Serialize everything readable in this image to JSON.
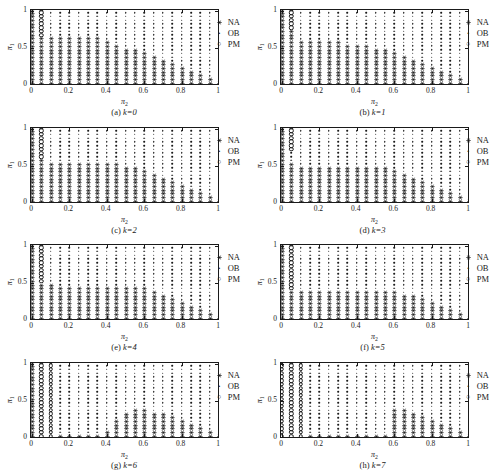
{
  "figure": {
    "panel_count": 8,
    "axis": {
      "xlabel": "π₂",
      "ylabel": "π₁",
      "xlim": [
        0,
        1
      ],
      "ylim": [
        0,
        1
      ],
      "xticks": [
        0,
        0.2,
        0.4,
        0.6,
        0.8,
        1
      ],
      "xticklabels": [
        "0",
        "0.2",
        "0.4",
        "0.6",
        "0.8",
        "1"
      ],
      "yticks": [
        0,
        0.5,
        1
      ],
      "yticklabels": [
        "0",
        "0.5",
        "1"
      ]
    },
    "legend": {
      "position": "top-right",
      "entries": [
        {
          "label": "NA",
          "marker": "asterisk-icon"
        },
        {
          "label": "OB",
          "marker": "dot-icon"
        },
        {
          "label": "PM",
          "marker": "open-circle-icon"
        }
      ]
    },
    "colors": {
      "marker": "#1a1a1a",
      "axis": "#1a1a1a",
      "background": "#ffffff"
    }
  },
  "chart_data": {
    "type": "scatter",
    "title": "",
    "xlabel": "π₂",
    "ylabel": "π₁",
    "xlim": [
      0,
      1
    ],
    "ylim": [
      0,
      1
    ],
    "grid": false,
    "legend": [
      "NA",
      "OB",
      "PM"
    ],
    "grid_step": 0.05,
    "panels": [
      {
        "id": "a",
        "label": "(a)",
        "k": 0,
        "caption_k": "k=0",
        "pm_columns": [
          {
            "x": 0.05,
            "y_min": 0.65,
            "y_max": 1.0
          }
        ],
        "na_boundary": [
          {
            "x": 0.0,
            "y_max": 1.0
          },
          {
            "x": 0.05,
            "y_max": 0.6
          },
          {
            "x": 0.1,
            "y_max": 0.6
          },
          {
            "x": 0.15,
            "y_max": 0.6
          },
          {
            "x": 0.2,
            "y_max": 0.6
          },
          {
            "x": 0.25,
            "y_max": 0.6
          },
          {
            "x": 0.3,
            "y_max": 0.6
          },
          {
            "x": 0.35,
            "y_max": 0.6
          },
          {
            "x": 0.4,
            "y_max": 0.55
          },
          {
            "x": 0.45,
            "y_max": 0.5
          },
          {
            "x": 0.5,
            "y_max": 0.45
          },
          {
            "x": 0.55,
            "y_max": 0.45
          },
          {
            "x": 0.6,
            "y_max": 0.4
          },
          {
            "x": 0.65,
            "y_max": 0.35
          },
          {
            "x": 0.7,
            "y_max": 0.3
          },
          {
            "x": 0.75,
            "y_max": 0.25
          },
          {
            "x": 0.8,
            "y_max": 0.2
          },
          {
            "x": 0.85,
            "y_max": 0.15
          },
          {
            "x": 0.9,
            "y_max": 0.1
          },
          {
            "x": 0.95,
            "y_max": 0.05
          },
          {
            "x": 1.0,
            "y_max": 0.0
          }
        ]
      },
      {
        "id": "b",
        "label": "(b)",
        "k": 1,
        "caption_k": "k=1",
        "pm_columns": [
          {
            "x": 0.05,
            "y_min": 0.75,
            "y_max": 1.0
          }
        ],
        "na_boundary": [
          {
            "x": 0.0,
            "y_max": 1.0
          },
          {
            "x": 0.05,
            "y_max": 0.7
          },
          {
            "x": 0.1,
            "y_max": 0.55
          },
          {
            "x": 0.15,
            "y_max": 0.55
          },
          {
            "x": 0.2,
            "y_max": 0.55
          },
          {
            "x": 0.25,
            "y_max": 0.55
          },
          {
            "x": 0.3,
            "y_max": 0.55
          },
          {
            "x": 0.35,
            "y_max": 0.5
          },
          {
            "x": 0.4,
            "y_max": 0.5
          },
          {
            "x": 0.45,
            "y_max": 0.5
          },
          {
            "x": 0.5,
            "y_max": 0.45
          },
          {
            "x": 0.55,
            "y_max": 0.45
          },
          {
            "x": 0.6,
            "y_max": 0.4
          },
          {
            "x": 0.65,
            "y_max": 0.35
          },
          {
            "x": 0.7,
            "y_max": 0.3
          },
          {
            "x": 0.75,
            "y_max": 0.25
          },
          {
            "x": 0.8,
            "y_max": 0.2
          },
          {
            "x": 0.85,
            "y_max": 0.15
          },
          {
            "x": 0.9,
            "y_max": 0.1
          },
          {
            "x": 0.95,
            "y_max": 0.05
          },
          {
            "x": 1.0,
            "y_max": 0.0
          }
        ]
      },
      {
        "id": "c",
        "label": "(c)",
        "k": 2,
        "caption_k": "k=2",
        "pm_columns": [
          {
            "x": 0.05,
            "y_min": 0.6,
            "y_max": 1.0
          }
        ],
        "na_boundary": [
          {
            "x": 0.0,
            "y_max": 1.0
          },
          {
            "x": 0.05,
            "y_max": 0.55
          },
          {
            "x": 0.1,
            "y_max": 0.5
          },
          {
            "x": 0.15,
            "y_max": 0.5
          },
          {
            "x": 0.2,
            "y_max": 0.5
          },
          {
            "x": 0.25,
            "y_max": 0.5
          },
          {
            "x": 0.3,
            "y_max": 0.5
          },
          {
            "x": 0.35,
            "y_max": 0.5
          },
          {
            "x": 0.4,
            "y_max": 0.5
          },
          {
            "x": 0.45,
            "y_max": 0.5
          },
          {
            "x": 0.5,
            "y_max": 0.45
          },
          {
            "x": 0.55,
            "y_max": 0.45
          },
          {
            "x": 0.6,
            "y_max": 0.4
          },
          {
            "x": 0.65,
            "y_max": 0.35
          },
          {
            "x": 0.7,
            "y_max": 0.3
          },
          {
            "x": 0.75,
            "y_max": 0.25
          },
          {
            "x": 0.8,
            "y_max": 0.2
          },
          {
            "x": 0.85,
            "y_max": 0.15
          },
          {
            "x": 0.9,
            "y_max": 0.1
          },
          {
            "x": 0.95,
            "y_max": 0.05
          },
          {
            "x": 1.0,
            "y_max": 0.0
          }
        ]
      },
      {
        "id": "d",
        "label": "(d)",
        "k": 3,
        "caption_k": "k=3",
        "pm_columns": [
          {
            "x": 0.05,
            "y_min": 0.7,
            "y_max": 1.0
          }
        ],
        "na_boundary": [
          {
            "x": 0.0,
            "y_max": 1.0
          },
          {
            "x": 0.05,
            "y_max": 0.5
          },
          {
            "x": 0.1,
            "y_max": 0.45
          },
          {
            "x": 0.15,
            "y_max": 0.45
          },
          {
            "x": 0.2,
            "y_max": 0.45
          },
          {
            "x": 0.25,
            "y_max": 0.45
          },
          {
            "x": 0.3,
            "y_max": 0.45
          },
          {
            "x": 0.35,
            "y_max": 0.45
          },
          {
            "x": 0.4,
            "y_max": 0.45
          },
          {
            "x": 0.45,
            "y_max": 0.45
          },
          {
            "x": 0.5,
            "y_max": 0.45
          },
          {
            "x": 0.55,
            "y_max": 0.45
          },
          {
            "x": 0.6,
            "y_max": 0.4
          },
          {
            "x": 0.65,
            "y_max": 0.35
          },
          {
            "x": 0.7,
            "y_max": 0.3
          },
          {
            "x": 0.75,
            "y_max": 0.25
          },
          {
            "x": 0.8,
            "y_max": 0.2
          },
          {
            "x": 0.85,
            "y_max": 0.15
          },
          {
            "x": 0.9,
            "y_max": 0.1
          },
          {
            "x": 0.95,
            "y_max": 0.05
          },
          {
            "x": 1.0,
            "y_max": 0.0
          }
        ]
      },
      {
        "id": "e",
        "label": "(e)",
        "k": 4,
        "caption_k": "k=4",
        "pm_columns": [
          {
            "x": 0.05,
            "y_min": 0.5,
            "y_max": 1.0
          }
        ],
        "na_boundary": [
          {
            "x": 0.0,
            "y_max": 1.0
          },
          {
            "x": 0.05,
            "y_max": 0.45
          },
          {
            "x": 0.1,
            "y_max": 0.45
          },
          {
            "x": 0.15,
            "y_max": 0.4
          },
          {
            "x": 0.2,
            "y_max": 0.4
          },
          {
            "x": 0.25,
            "y_max": 0.4
          },
          {
            "x": 0.3,
            "y_max": 0.4
          },
          {
            "x": 0.35,
            "y_max": 0.4
          },
          {
            "x": 0.4,
            "y_max": 0.4
          },
          {
            "x": 0.45,
            "y_max": 0.4
          },
          {
            "x": 0.5,
            "y_max": 0.4
          },
          {
            "x": 0.55,
            "y_max": 0.4
          },
          {
            "x": 0.6,
            "y_max": 0.4
          },
          {
            "x": 0.65,
            "y_max": 0.35
          },
          {
            "x": 0.7,
            "y_max": 0.3
          },
          {
            "x": 0.75,
            "y_max": 0.25
          },
          {
            "x": 0.8,
            "y_max": 0.2
          },
          {
            "x": 0.85,
            "y_max": 0.15
          },
          {
            "x": 0.9,
            "y_max": 0.1
          },
          {
            "x": 0.95,
            "y_max": 0.05
          },
          {
            "x": 1.0,
            "y_max": 0.0
          }
        ]
      },
      {
        "id": "f",
        "label": "(f)",
        "k": 5,
        "caption_k": "k=5",
        "pm_columns": [
          {
            "x": 0.05,
            "y_min": 0.4,
            "y_max": 1.0
          }
        ],
        "na_boundary": [
          {
            "x": 0.0,
            "y_max": 1.0
          },
          {
            "x": 0.05,
            "y_max": 0.35
          },
          {
            "x": 0.1,
            "y_max": 0.35
          },
          {
            "x": 0.15,
            "y_max": 0.35
          },
          {
            "x": 0.2,
            "y_max": 0.35
          },
          {
            "x": 0.25,
            "y_max": 0.35
          },
          {
            "x": 0.3,
            "y_max": 0.35
          },
          {
            "x": 0.35,
            "y_max": 0.35
          },
          {
            "x": 0.4,
            "y_max": 0.35
          },
          {
            "x": 0.45,
            "y_max": 0.35
          },
          {
            "x": 0.5,
            "y_max": 0.35
          },
          {
            "x": 0.55,
            "y_max": 0.35
          },
          {
            "x": 0.6,
            "y_max": 0.35
          },
          {
            "x": 0.65,
            "y_max": 0.3
          },
          {
            "x": 0.7,
            "y_max": 0.3
          },
          {
            "x": 0.75,
            "y_max": 0.25
          },
          {
            "x": 0.8,
            "y_max": 0.2
          },
          {
            "x": 0.85,
            "y_max": 0.15
          },
          {
            "x": 0.9,
            "y_max": 0.1
          },
          {
            "x": 0.95,
            "y_max": 0.05
          },
          {
            "x": 1.0,
            "y_max": 0.0
          }
        ]
      },
      {
        "id": "g",
        "label": "(g)",
        "k": 6,
        "caption_k": "k=6",
        "pm_columns": [
          {
            "x": 0.05,
            "y_min": 0.0,
            "y_max": 1.0
          },
          {
            "x": 0.1,
            "y_min": 0.0,
            "y_max": 1.0
          }
        ],
        "na_boundary": [
          {
            "x": 0.0,
            "y_max": 1.0
          },
          {
            "x": 0.05,
            "y_max": 0.0
          },
          {
            "x": 0.1,
            "y_max": 0.0
          },
          {
            "x": 0.15,
            "y_max": 0.0
          },
          {
            "x": 0.2,
            "y_max": 0.0
          },
          {
            "x": 0.25,
            "y_max": 0.0
          },
          {
            "x": 0.3,
            "y_max": 0.0
          },
          {
            "x": 0.35,
            "y_max": 0.0
          },
          {
            "x": 0.4,
            "y_max": 0.05
          },
          {
            "x": 0.45,
            "y_max": 0.2
          },
          {
            "x": 0.5,
            "y_max": 0.3
          },
          {
            "x": 0.55,
            "y_max": 0.35
          },
          {
            "x": 0.6,
            "y_max": 0.35
          },
          {
            "x": 0.65,
            "y_max": 0.3
          },
          {
            "x": 0.7,
            "y_max": 0.3
          },
          {
            "x": 0.75,
            "y_max": 0.25
          },
          {
            "x": 0.8,
            "y_max": 0.2
          },
          {
            "x": 0.85,
            "y_max": 0.15
          },
          {
            "x": 0.9,
            "y_max": 0.1
          },
          {
            "x": 0.95,
            "y_max": 0.05
          },
          {
            "x": 1.0,
            "y_max": 0.0
          }
        ]
      },
      {
        "id": "h",
        "label": "(h)",
        "k": 7,
        "caption_k": "k=7",
        "pm_columns": [
          {
            "x": 0.0,
            "y_min": 0.0,
            "y_max": 1.0
          },
          {
            "x": 0.05,
            "y_min": 0.0,
            "y_max": 1.0
          },
          {
            "x": 0.1,
            "y_min": 0.0,
            "y_max": 1.0
          }
        ],
        "na_boundary": [
          {
            "x": 0.0,
            "y_max": 0.0
          },
          {
            "x": 0.05,
            "y_max": 0.0
          },
          {
            "x": 0.1,
            "y_max": 0.0
          },
          {
            "x": 0.15,
            "y_max": 0.0
          },
          {
            "x": 0.2,
            "y_max": 0.0
          },
          {
            "x": 0.25,
            "y_max": 0.0
          },
          {
            "x": 0.3,
            "y_max": 0.0
          },
          {
            "x": 0.35,
            "y_max": 0.0
          },
          {
            "x": 0.4,
            "y_max": 0.0
          },
          {
            "x": 0.45,
            "y_max": 0.0
          },
          {
            "x": 0.5,
            "y_max": 0.0
          },
          {
            "x": 0.55,
            "y_max": 0.0
          },
          {
            "x": 0.6,
            "y_max": 0.35
          },
          {
            "x": 0.65,
            "y_max": 0.35
          },
          {
            "x": 0.7,
            "y_max": 0.3
          },
          {
            "x": 0.75,
            "y_max": 0.25
          },
          {
            "x": 0.8,
            "y_max": 0.2
          },
          {
            "x": 0.85,
            "y_max": 0.15
          },
          {
            "x": 0.9,
            "y_max": 0.1
          },
          {
            "x": 0.95,
            "y_max": 0.05
          },
          {
            "x": 1.0,
            "y_max": 0.0
          }
        ]
      }
    ]
  }
}
